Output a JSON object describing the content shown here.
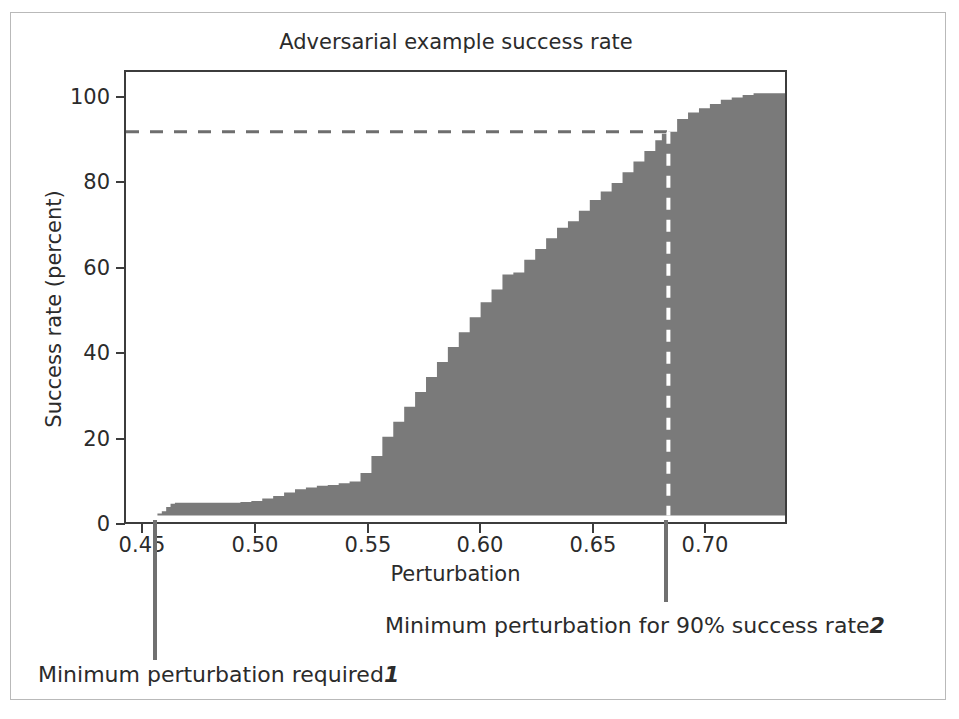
{
  "chart_data": {
    "type": "area",
    "title": "Adversarial example success rate",
    "xlabel": "Perturbation",
    "ylabel": "Success rate (percent)",
    "xlim": [
      0.4376,
      0.7394
    ],
    "ylim": [
      -1.5,
      104.0
    ],
    "xticks": [
      0.45,
      0.5,
      0.55,
      0.6,
      0.65,
      0.7
    ],
    "xticklabels": [
      "0.45",
      "0.50",
      "0.55",
      "0.60",
      "0.65",
      "0.70"
    ],
    "yticks": [
      0,
      20,
      40,
      60,
      80,
      100
    ],
    "yticklabels": [
      "0",
      "20",
      "40",
      "60",
      "80",
      "100"
    ],
    "grid": false,
    "legend": null,
    "fill_color": "#7a7a7a",
    "axis_color": "#3c3c3c",
    "x": [
      0.45,
      0.452,
      0.454,
      0.456,
      0.458,
      0.46,
      0.463,
      0.466,
      0.47,
      0.475,
      0.48,
      0.485,
      0.49,
      0.495,
      0.5,
      0.505,
      0.51,
      0.515,
      0.52,
      0.525,
      0.53,
      0.535,
      0.54,
      0.545,
      0.55,
      0.555,
      0.56,
      0.565,
      0.57,
      0.575,
      0.58,
      0.585,
      0.59,
      0.595,
      0.6,
      0.605,
      0.61,
      0.615,
      0.62,
      0.625,
      0.63,
      0.635,
      0.64,
      0.645,
      0.65,
      0.655,
      0.66,
      0.665,
      0.67,
      0.675,
      0.68,
      0.683,
      0.686,
      0.69,
      0.695,
      0.7,
      0.705,
      0.71,
      0.715,
      0.72,
      0.725,
      0.73,
      0.735,
      0.739
    ],
    "y": [
      0.0,
      0.5,
      1.0,
      2.0,
      2.8,
      3.0,
      3.0,
      3.0,
      3.0,
      3.0,
      3.0,
      3.0,
      3.2,
      3.4,
      4.0,
      4.6,
      5.4,
      6.2,
      6.6,
      7.0,
      7.2,
      7.6,
      8.0,
      10.0,
      14.0,
      18.5,
      22.0,
      25.5,
      29.0,
      32.5,
      36.0,
      39.5,
      43.0,
      46.5,
      50.0,
      53.0,
      56.5,
      57.0,
      60.0,
      62.5,
      65.0,
      67.5,
      69.0,
      71.5,
      74.0,
      76.0,
      78.0,
      80.5,
      83.0,
      85.5,
      88.0,
      89.5,
      90.0,
      93.0,
      94.5,
      95.5,
      96.5,
      97.5,
      98.0,
      98.6,
      99.0,
      99.0,
      99.0,
      99.0
    ],
    "reference_lines": [
      {
        "name": "ninety-percent-threshold",
        "orientation": "horizontal",
        "value": 90,
        "style": "dashed",
        "color": "#6e6e6e",
        "x_end": 0.686
      },
      {
        "name": "minimum-perturbation-90-marker",
        "orientation": "vertical",
        "value": 0.686,
        "style": "dashed",
        "color": "#ffffff"
      }
    ],
    "annotations": [
      {
        "id": "1",
        "name": "minimum-perturbation-required",
        "text": "Minimum perturbation required",
        "marker_number": "1",
        "x_value": 0.4512
      },
      {
        "id": "2",
        "name": "minimum-perturbation-90-success",
        "text": "Minimum perturbation for 90% success rate",
        "marker_number": "2",
        "x_value": 0.686
      }
    ]
  },
  "figure": {
    "title": "Adversarial example success rate",
    "x_axis_label": "Perturbation",
    "y_axis_label": "Success rate (percent)",
    "x_tick_labels": [
      "0.45",
      "0.50",
      "0.55",
      "0.60",
      "0.65",
      "0.70"
    ],
    "y_tick_labels": [
      "0",
      "20",
      "40",
      "60",
      "80",
      "100"
    ],
    "callout_1_text": "Minimum perturbation required",
    "callout_1_number": "1",
    "callout_2_text": "Minimum perturbation for 90% success rate",
    "callout_2_number": "2"
  }
}
